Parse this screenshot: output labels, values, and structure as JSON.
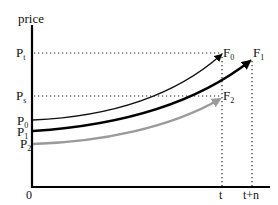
{
  "diagram": {
    "y_axis_label": "price",
    "origin_label": "0",
    "x_ticks": [
      {
        "label": "t"
      },
      {
        "label": "t+n"
      }
    ],
    "y_levels": [
      {
        "label": "P",
        "sub": "t"
      },
      {
        "label": "P",
        "sub": "s"
      }
    ],
    "curves": [
      {
        "start_label": "P",
        "start_sub": "0",
        "end_label": "F",
        "end_sub": "0",
        "color": "#111111",
        "width": 1.4
      },
      {
        "start_label": "P",
        "start_sub": "1",
        "end_label": "F",
        "end_sub": "1",
        "color": "#000000",
        "width": 2.4
      },
      {
        "start_label": "P",
        "start_sub": "2",
        "end_label": "F",
        "end_sub": "2",
        "color": "#9a9a9a",
        "width": 2.4
      }
    ]
  }
}
